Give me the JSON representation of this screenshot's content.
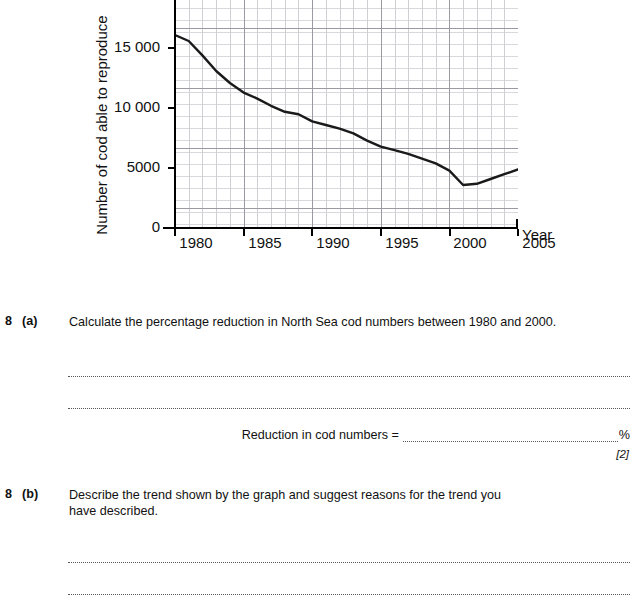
{
  "chart_data": {
    "type": "line",
    "title": "",
    "xlabel": "Year",
    "ylabel": "Number of cod able to reproduce",
    "xlim": [
      1980,
      2005
    ],
    "ylim": [
      0,
      17500
    ],
    "xticks": [
      1980,
      1985,
      1990,
      1995,
      2000,
      2005
    ],
    "xtick_labels": [
      "1980",
      "1985",
      "1990",
      "1995",
      "2000",
      "2005"
    ],
    "yticks": [
      0,
      5000,
      10000,
      15000
    ],
    "ytick_labels": [
      "0",
      "5000",
      "10 000",
      "15 000"
    ],
    "grid": true,
    "legend": "none",
    "series": [
      {
        "name": "North Sea cod able to reproduce",
        "color": "#1a1a1a",
        "x": [
          1980,
          1981,
          1982,
          1983,
          1984,
          1985,
          1986,
          1987,
          1988,
          1989,
          1990,
          1991,
          1992,
          1993,
          1994,
          1995,
          1996,
          1997,
          1998,
          1999,
          2000,
          2001,
          2002,
          2003,
          2004,
          2005
        ],
        "values": [
          16000,
          15500,
          14300,
          13000,
          12000,
          11200,
          10700,
          10100,
          9600,
          9400,
          8800,
          8500,
          8200,
          7800,
          7200,
          6700,
          6400,
          6100,
          5700,
          5300,
          4700,
          3500,
          3600,
          4000,
          4400,
          4800
        ]
      }
    ]
  },
  "chart": {
    "y_axis_title": "Number of cod able to reproduce",
    "x_axis_title": "Year",
    "y_labels": [
      "15 000",
      "10 000",
      "5000",
      "0"
    ],
    "x_labels": [
      "1980",
      "1985",
      "1990",
      "1995",
      "2000",
      "2005"
    ]
  },
  "questions": [
    {
      "number": "8",
      "part": "(a)",
      "text": "Calculate the percentage reduction in North Sea cod numbers between 1980 and 2000.",
      "answer_label": "Reduction in cod numbers =",
      "answer_unit": "%",
      "marks": "[2]"
    },
    {
      "number": "8",
      "part": "(b)",
      "text": "Describe the trend shown by the graph and suggest reasons for the trend you have described.",
      "marks": ""
    }
  ]
}
